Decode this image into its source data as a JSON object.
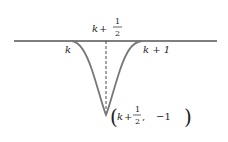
{
  "diagram": {
    "title": "",
    "axis": {
      "y": 41,
      "x_start": 14,
      "x_end": 217,
      "color": "#555555"
    },
    "curve": {
      "x_left": 72,
      "x_right": 142,
      "x_min": 106,
      "y_min": 115,
      "color": "#777777"
    },
    "labels": {
      "top_var": "k",
      "top_plus": "+",
      "top_frac_num": "1",
      "top_frac_den": "2",
      "left": "k",
      "right": "k + 1",
      "point_open": "(",
      "point_var": "k",
      "point_plus": "+",
      "point_frac_num": "1",
      "point_frac_den": "2",
      "point_sep": ",",
      "point_y": "−1",
      "point_close": ")"
    }
  }
}
